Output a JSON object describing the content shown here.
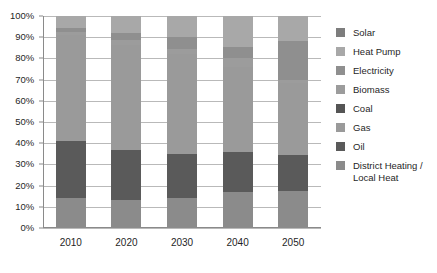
{
  "chart_data": {
    "type": "bar",
    "variant": "stacked-100-percent",
    "title": "",
    "subtitle": "",
    "xlabel": "",
    "ylabel": "",
    "categories": [
      "2010",
      "2020",
      "2030",
      "2040",
      "2050"
    ],
    "ylim": [
      0,
      100
    ],
    "ytick_labels": [
      "0%",
      "10%",
      "20%",
      "30%",
      "40%",
      "50%",
      "60%",
      "70%",
      "80%",
      "90%",
      "100%"
    ],
    "ytick_values": [
      0,
      10,
      20,
      30,
      40,
      50,
      60,
      70,
      80,
      90,
      100
    ],
    "grid": true,
    "grid_axis": "y",
    "legend_position": "right",
    "stack_order_bottom_to_top": [
      "District Heating / Local Heat",
      "Oil",
      "Gas",
      "Coal",
      "Biomass",
      "Electricity",
      "Heat Pump",
      "Solar"
    ],
    "series": [
      {
        "name": "Solar",
        "color": "#7d7d7d",
        "values": [
          0.0,
          0.0,
          0.0,
          0.0,
          0.0
        ]
      },
      {
        "name": "Heat Pump",
        "color": "#a8a8a8",
        "values": [
          5.5,
          8.0,
          10.0,
          14.5,
          12.0
        ]
      },
      {
        "name": "Electricity",
        "color": "#8f8f8f",
        "values": [
          2.0,
          3.5,
          5.5,
          5.5,
          18.0
        ]
      },
      {
        "name": "Biomass",
        "color": "#9c9c9c",
        "values": [
          1.5,
          2.0,
          2.5,
          4.0,
          1.5
        ]
      },
      {
        "name": "Coal",
        "color": "#555555",
        "values": [
          0.0,
          0.0,
          0.0,
          0.0,
          0.0
        ]
      },
      {
        "name": "Gas",
        "color": "#9a9a9a",
        "values": [
          50.0,
          49.5,
          47.0,
          40.0,
          34.0
        ]
      },
      {
        "name": "Oil",
        "color": "#5a5a5a",
        "values": [
          27.0,
          24.0,
          21.0,
          19.0,
          17.0
        ]
      },
      {
        "name": "District Heating / Local Heat",
        "color": "#8b8b8b",
        "values": [
          14.0,
          13.0,
          14.0,
          17.0,
          17.5
        ]
      }
    ],
    "bars": [
      {
        "category": "2010",
        "segments": [
          {
            "name": "District Heating / Local Heat",
            "start": 0.0,
            "end": 14.0,
            "color": "#8b8b8b"
          },
          {
            "name": "Oil",
            "start": 14.0,
            "end": 41.0,
            "color": "#5a5a5a"
          },
          {
            "name": "Gas",
            "start": 41.0,
            "end": 91.0,
            "color": "#9a9a9a"
          },
          {
            "name": "Biomass",
            "start": 91.0,
            "end": 92.5,
            "color": "#9c9c9c"
          },
          {
            "name": "Electricity",
            "start": 92.5,
            "end": 94.5,
            "color": "#8f8f8f"
          },
          {
            "name": "Heat Pump",
            "start": 94.5,
            "end": 100.0,
            "color": "#a8a8a8"
          }
        ]
      },
      {
        "category": "2020",
        "segments": [
          {
            "name": "District Heating / Local Heat",
            "start": 0.0,
            "end": 13.0,
            "color": "#8b8b8b"
          },
          {
            "name": "Oil",
            "start": 13.0,
            "end": 37.0,
            "color": "#5a5a5a"
          },
          {
            "name": "Gas",
            "start": 37.0,
            "end": 86.5,
            "color": "#9a9a9a"
          },
          {
            "name": "Biomass",
            "start": 86.5,
            "end": 88.5,
            "color": "#9c9c9c"
          },
          {
            "name": "Electricity",
            "start": 88.5,
            "end": 92.0,
            "color": "#8f8f8f"
          },
          {
            "name": "Heat Pump",
            "start": 92.0,
            "end": 100.0,
            "color": "#a8a8a8"
          }
        ]
      },
      {
        "category": "2030",
        "segments": [
          {
            "name": "District Heating / Local Heat",
            "start": 0.0,
            "end": 14.0,
            "color": "#8b8b8b"
          },
          {
            "name": "Oil",
            "start": 14.0,
            "end": 35.0,
            "color": "#5a5a5a"
          },
          {
            "name": "Gas",
            "start": 35.0,
            "end": 82.0,
            "color": "#9a9a9a"
          },
          {
            "name": "Biomass",
            "start": 82.0,
            "end": 84.5,
            "color": "#9c9c9c"
          },
          {
            "name": "Electricity",
            "start": 84.5,
            "end": 90.0,
            "color": "#8f8f8f"
          },
          {
            "name": "Heat Pump",
            "start": 90.0,
            "end": 100.0,
            "color": "#a8a8a8"
          }
        ]
      },
      {
        "category": "2040",
        "segments": [
          {
            "name": "District Heating / Local Heat",
            "start": 0.0,
            "end": 17.0,
            "color": "#8b8b8b"
          },
          {
            "name": "Oil",
            "start": 17.0,
            "end": 36.0,
            "color": "#5a5a5a"
          },
          {
            "name": "Gas",
            "start": 36.0,
            "end": 76.0,
            "color": "#9a9a9a"
          },
          {
            "name": "Biomass",
            "start": 76.0,
            "end": 80.0,
            "color": "#9c9c9c"
          },
          {
            "name": "Electricity",
            "start": 80.0,
            "end": 85.5,
            "color": "#8f8f8f"
          },
          {
            "name": "Heat Pump",
            "start": 85.5,
            "end": 100.0,
            "color": "#a8a8a8"
          }
        ]
      },
      {
        "category": "2050",
        "segments": [
          {
            "name": "District Heating / Local Heat",
            "start": 0.0,
            "end": 17.5,
            "color": "#8b8b8b"
          },
          {
            "name": "Oil",
            "start": 17.5,
            "end": 34.5,
            "color": "#5a5a5a"
          },
          {
            "name": "Gas",
            "start": 34.5,
            "end": 68.5,
            "color": "#9a9a9a"
          },
          {
            "name": "Biomass",
            "start": 68.5,
            "end": 70.0,
            "color": "#9c9c9c"
          },
          {
            "name": "Electricity",
            "start": 70.0,
            "end": 88.0,
            "color": "#8f8f8f"
          },
          {
            "name": "Heat Pump",
            "start": 88.0,
            "end": 100.0,
            "color": "#a8a8a8"
          }
        ]
      }
    ]
  },
  "legend": {
    "items": [
      {
        "label": "Solar",
        "color": "#7d7d7d"
      },
      {
        "label": "Heat Pump",
        "color": "#a8a8a8"
      },
      {
        "label": "Electricity",
        "color": "#8f8f8f"
      },
      {
        "label": "Biomass",
        "color": "#9c9c9c"
      },
      {
        "label": "Coal",
        "color": "#555555"
      },
      {
        "label": "Gas",
        "color": "#9a9a9a"
      },
      {
        "label": "Oil",
        "color": "#5a5a5a"
      },
      {
        "label": "District Heating /\nLocal Heat",
        "color": "#8b8b8b"
      }
    ]
  },
  "style": {
    "gridline_color": "#b9b9b9",
    "axis_color": "#8a8a8a",
    "text_color": "#1f1f1f",
    "background": "#ffffff"
  }
}
